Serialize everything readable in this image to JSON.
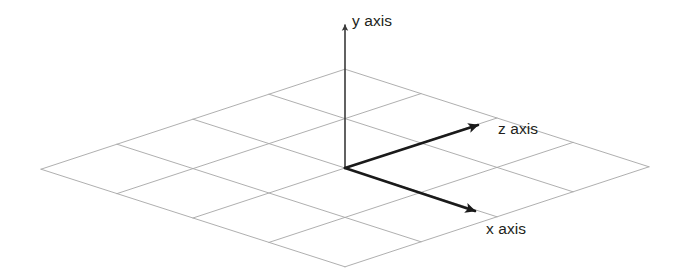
{
  "diagram": {
    "type": "isometric-axes",
    "background_color": "#ffffff",
    "grid": {
      "color": "#a6a6a6",
      "line_width": 0.9,
      "cells_u": 4,
      "cells_v": 4,
      "origin": {
        "x": 345,
        "y": 168
      },
      "basis_u": {
        "x": 76.0,
        "y": 24.4
      },
      "basis_v": {
        "x": 76.0,
        "y": -25.0
      },
      "corner_left": {
        "x": 41,
        "y": 167
      },
      "corner_top": {
        "x": 345,
        "y": 68
      },
      "corner_right": {
        "x": 649,
        "y": 171
      },
      "corner_bottom": {
        "x": 345,
        "y": 266
      }
    },
    "axes": [
      {
        "id": "y",
        "label": "y axis",
        "color": "#3a3a3a",
        "line_width": 1.6,
        "start": {
          "x": 345,
          "y": 168
        },
        "end": {
          "x": 345,
          "y": 25
        },
        "arrow_tip": {
          "x": 345,
          "y": 17
        },
        "label_pos": {
          "x": 352,
          "y": 26
        }
      },
      {
        "id": "z",
        "label": "z axis",
        "color": "#1a1a1a",
        "line_width": 2.6,
        "start": {
          "x": 345,
          "y": 168
        },
        "end": {
          "x": 478,
          "y": 125
        },
        "arrow_tip": {
          "x": 492,
          "y": 119
        },
        "label_pos": {
          "x": 498,
          "y": 134
        }
      },
      {
        "id": "x",
        "label": "x axis",
        "color": "#1a1a1a",
        "line_width": 2.6,
        "start": {
          "x": 345,
          "y": 168
        },
        "end": {
          "x": 475,
          "y": 211
        },
        "arrow_tip": {
          "x": 490,
          "y": 216
        },
        "label_pos": {
          "x": 486,
          "y": 234
        }
      }
    ]
  }
}
